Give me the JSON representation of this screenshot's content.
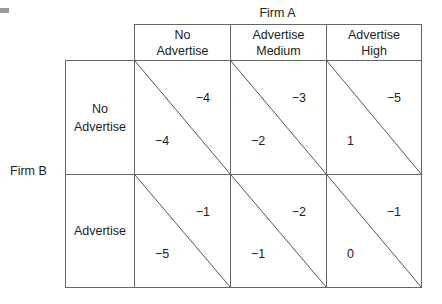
{
  "decoration": {
    "corner_mark": "gray-bar"
  },
  "firm_a": {
    "label": "Firm A"
  },
  "firm_b": {
    "label": "Firm B"
  },
  "columns": [
    {
      "label": "No\nAdvertise"
    },
    {
      "label": "Advertise\nMedium"
    },
    {
      "label": "Advertise\nHigh"
    }
  ],
  "rows": [
    {
      "label": "No\nAdvertise",
      "cells": [
        {
          "firm_a_payoff": "−4",
          "firm_b_payoff": "−4"
        },
        {
          "firm_a_payoff": "−3",
          "firm_b_payoff": "−2"
        },
        {
          "firm_a_payoff": "−5",
          "firm_b_payoff": "1"
        }
      ]
    },
    {
      "label": "Advertise",
      "cells": [
        {
          "firm_a_payoff": "−1",
          "firm_b_payoff": "−5"
        },
        {
          "firm_a_payoff": "−2",
          "firm_b_payoff": "−1"
        },
        {
          "firm_a_payoff": "−1",
          "firm_b_payoff": "0"
        }
      ]
    }
  ]
}
